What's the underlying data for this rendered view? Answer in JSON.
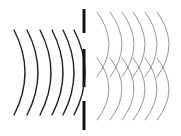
{
  "diagram": {
    "colors": {
      "background": "#ffffff",
      "incident_wave": "#222222",
      "diffracted_wave": "#8a8a8a",
      "barrier": "#111111"
    },
    "barrier": {
      "x": 84,
      "segments": [
        [
          9,
          33
        ],
        [
          49,
          87
        ],
        [
          101,
          130
        ]
      ]
    },
    "incident_waves": {
      "count": 6,
      "x_ends": [
        14,
        27,
        40,
        52,
        63,
        74
      ],
      "y_top": 30,
      "y_bottom": 115,
      "bulge": 11
    },
    "diffracted_waves": {
      "upper_slit": {
        "count": 6,
        "x_ends": [
          97,
          110,
          122,
          133,
          145,
          157
        ],
        "y_top": 12,
        "y_bottom": 77,
        "bulge": 12
      },
      "lower_slit": {
        "count": 6,
        "x_ends": [
          97,
          110,
          122,
          133,
          145,
          157
        ],
        "y_top": 58,
        "y_bottom": 120,
        "bulge": 12
      }
    }
  }
}
